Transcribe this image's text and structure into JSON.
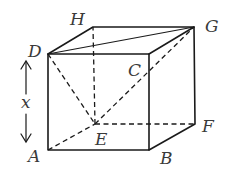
{
  "diagram": {
    "type": "cube",
    "vertices": {
      "A": {
        "label": "A",
        "x": 48,
        "y": 150
      },
      "B": {
        "label": "B",
        "x": 149,
        "y": 150
      },
      "C": {
        "label": "C",
        "x": 149,
        "y": 54
      },
      "D": {
        "label": "D",
        "x": 48,
        "y": 54
      },
      "E": {
        "label": "E",
        "x": 95,
        "y": 124
      },
      "F": {
        "label": "F",
        "x": 195,
        "y": 124
      },
      "G": {
        "label": "G",
        "x": 194,
        "y": 27
      },
      "H": {
        "label": "H",
        "x": 93,
        "y": 27
      }
    },
    "dimension": {
      "label": "x",
      "from": "A",
      "to": "D"
    },
    "edges_solid": [
      "AB",
      "BC",
      "CD",
      "DA",
      "DH",
      "HG",
      "GC",
      "GF",
      "FB",
      "DG"
    ],
    "edges_dashed": [
      "AE",
      "EF",
      "EH",
      "DE",
      "EG"
    ]
  }
}
